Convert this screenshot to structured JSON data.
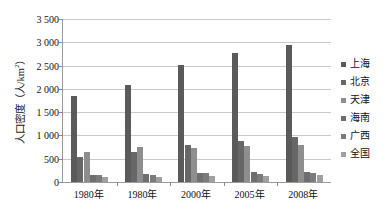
{
  "chart_data": {
    "type": "bar",
    "title": "",
    "xlabel": "",
    "ylabel": "人口密度（人/km²）",
    "ylim": [
      0,
      3500
    ],
    "ytick_step": 500,
    "grid": true,
    "legend_position": "right",
    "categories": [
      "1980年",
      "1980年",
      "2000年",
      "2005年",
      "2008年"
    ],
    "yticks": [
      "3 500",
      "3 000",
      "2 500",
      "2 000",
      "1 500",
      "1 000",
      "500",
      "0"
    ],
    "series": [
      {
        "name": "上海",
        "color": "#5a5a5a",
        "values": [
          1850,
          2090,
          2510,
          2780,
          2950
        ]
      },
      {
        "name": "北京",
        "color": "#676767",
        "values": [
          530,
          640,
          790,
          890,
          970
        ]
      },
      {
        "name": "天津",
        "color": "#8e8e8e",
        "values": [
          650,
          745,
          740,
          770,
          790
        ]
      },
      {
        "name": "海南",
        "color": "#6e6e6e",
        "values": [
          140,
          165,
          190,
          205,
          215
        ]
      },
      {
        "name": "广西",
        "color": "#7b7b7b",
        "values": [
          140,
          160,
          190,
          180,
          185
        ]
      },
      {
        "name": "全国",
        "color": "#a0a0a0",
        "values": [
          100,
          110,
          130,
          135,
          140
        ]
      }
    ]
  },
  "axis": {
    "y_title_main": "人口密度（人/km",
    "y_title_sup": "2",
    "y_title_tail": "）"
  }
}
